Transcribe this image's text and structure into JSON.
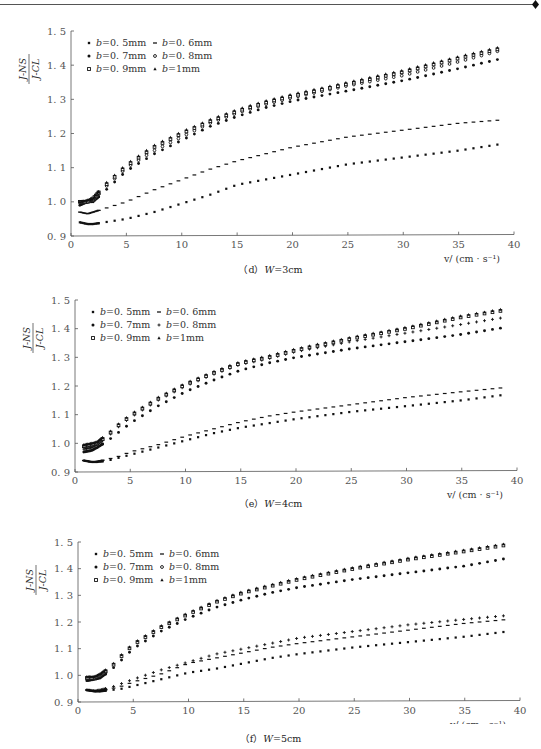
{
  "page": {
    "header_text": "· · · · · · ·"
  },
  "common": {
    "ylabel_num": "J-NS",
    "ylabel_den": "J-CL",
    "xlabel": "v/ (cm · s⁻¹)",
    "xticks": [
      0,
      5,
      10,
      15,
      20,
      25,
      30,
      35,
      40
    ],
    "yticks": [
      "0. 9",
      "1. 0",
      "1. 1",
      "1. 2",
      "1. 3",
      "1. 4",
      "1. 5"
    ],
    "legend": [
      {
        "label": "b=0. 5mm",
        "marker": "square-small"
      },
      {
        "label": "b=0. 6mm",
        "marker": "dash"
      },
      {
        "label": "b=0. 7mm",
        "marker": "dot"
      },
      {
        "label": "b=0. 8mm",
        "marker": "circle-open"
      },
      {
        "label": "b=0. 9mm",
        "marker": "square-open"
      },
      {
        "label": "b=1mm",
        "marker": "triangle"
      }
    ]
  },
  "chart_data": [
    {
      "type": "scatter",
      "id": "d",
      "caption_prefix": "（d）",
      "caption_var": "W",
      "caption_value": "=3cm",
      "title": "(d) W=3cm",
      "xlabel": "v/(cm·s⁻¹)",
      "ylabel": "J-NS / J-CL",
      "xlim": [
        0,
        40
      ],
      "ylim": [
        0.9,
        1.5
      ],
      "x": [
        0.8,
        1.5,
        2,
        3,
        4,
        5,
        7.5,
        10,
        12.5,
        15,
        17.5,
        20,
        25,
        30,
        35,
        39
      ],
      "series": [
        {
          "name": "b=0.5mm",
          "values": [
            0.94,
            0.935,
            0.935,
            0.94,
            0.945,
            0.95,
            0.97,
            0.995,
            1.02,
            1.05,
            1.065,
            1.08,
            1.11,
            1.13,
            1.15,
            1.17
          ]
        },
        {
          "name": "b=0.6mm",
          "values": [
            0.97,
            0.965,
            0.97,
            0.98,
            0.99,
            1.0,
            1.035,
            1.065,
            1.095,
            1.12,
            1.14,
            1.16,
            1.19,
            1.21,
            1.23,
            1.24
          ]
        },
        {
          "name": "b=0.7mm",
          "values": [
            0.99,
            1.0,
            1.0,
            1.03,
            1.06,
            1.09,
            1.14,
            1.18,
            1.22,
            1.25,
            1.275,
            1.295,
            1.325,
            1.355,
            1.39,
            1.42
          ]
        },
        {
          "name": "b=0.8mm",
          "values": [
            1.0,
            1.0,
            1.005,
            1.04,
            1.07,
            1.1,
            1.15,
            1.19,
            1.23,
            1.26,
            1.285,
            1.305,
            1.34,
            1.37,
            1.41,
            1.445
          ]
        },
        {
          "name": "b=0.9mm",
          "values": [
            1.0,
            1.0,
            1.01,
            1.045,
            1.075,
            1.105,
            1.16,
            1.2,
            1.235,
            1.265,
            1.29,
            1.31,
            1.345,
            1.38,
            1.42,
            1.45
          ]
        },
        {
          "name": "b=1mm",
          "values": [
            1.0,
            1.005,
            1.01,
            1.05,
            1.08,
            1.11,
            1.165,
            1.205,
            1.24,
            1.27,
            1.295,
            1.315,
            1.35,
            1.385,
            1.425,
            1.455
          ]
        }
      ],
      "legend_position": "upper-left"
    },
    {
      "type": "scatter",
      "id": "e",
      "caption_prefix": "（e）",
      "caption_var": "W",
      "caption_value": "=4cm",
      "title": "(e) W=4cm",
      "xlabel": "v/(cm·s⁻¹)",
      "ylabel": "J-NS / J-CL",
      "xlim": [
        0,
        40
      ],
      "ylim": [
        0.9,
        1.5
      ],
      "x": [
        0.8,
        1.5,
        2,
        3,
        4,
        5,
        7.5,
        10,
        12.5,
        15,
        17.5,
        20,
        25,
        30,
        35,
        39
      ],
      "series": [
        {
          "name": "b=0.5mm",
          "values": [
            0.94,
            0.935,
            0.935,
            0.94,
            0.95,
            0.96,
            0.985,
            1.01,
            1.035,
            1.055,
            1.07,
            1.085,
            1.11,
            1.13,
            1.15,
            1.17
          ]
        },
        {
          "name": "b=0.6mm",
          "values": [
            0.94,
            0.935,
            0.937,
            0.945,
            0.955,
            0.97,
            0.995,
            1.025,
            1.05,
            1.075,
            1.095,
            1.11,
            1.135,
            1.16,
            1.18,
            1.195
          ]
        },
        {
          "name": "b=0.7mm",
          "values": [
            0.97,
            0.975,
            0.985,
            1.01,
            1.04,
            1.07,
            1.13,
            1.18,
            1.22,
            1.255,
            1.28,
            1.3,
            1.33,
            1.355,
            1.38,
            1.405
          ]
        },
        {
          "name": "b=0.8mm",
          "values": [
            0.98,
            0.985,
            0.995,
            1.025,
            1.06,
            1.09,
            1.15,
            1.2,
            1.24,
            1.275,
            1.295,
            1.32,
            1.355,
            1.385,
            1.415,
            1.44
          ]
        },
        {
          "name": "b=0.9mm",
          "values": [
            0.99,
            0.995,
            1.0,
            1.03,
            1.065,
            1.095,
            1.155,
            1.205,
            1.245,
            1.28,
            1.3,
            1.325,
            1.365,
            1.4,
            1.44,
            1.465
          ]
        },
        {
          "name": "b=1mm",
          "values": [
            0.995,
            1.0,
            1.005,
            1.035,
            1.07,
            1.1,
            1.16,
            1.21,
            1.25,
            1.285,
            1.305,
            1.33,
            1.37,
            1.405,
            1.445,
            1.47
          ]
        }
      ],
      "legend_position": "upper-left"
    },
    {
      "type": "scatter",
      "id": "f",
      "caption_prefix": "（f）",
      "caption_var": "W",
      "caption_value": "=5cm",
      "title": "(f) W=5cm",
      "xlabel": "v/(cm·s⁻¹)",
      "ylabel": "J-NS / J-CL",
      "xlim": [
        0,
        40
      ],
      "ylim": [
        0.9,
        1.5
      ],
      "x": [
        0.8,
        1.5,
        2,
        3,
        4,
        5,
        7.5,
        10,
        12.5,
        15,
        17.5,
        20,
        25,
        30,
        35,
        39
      ],
      "series": [
        {
          "name": "b=0.5mm",
          "values": [
            0.945,
            0.94,
            0.94,
            0.945,
            0.95,
            0.96,
            0.985,
            1.01,
            1.025,
            1.045,
            1.065,
            1.08,
            1.105,
            1.125,
            1.145,
            1.165
          ]
        },
        {
          "name": "b=0.6mm",
          "values": [
            0.945,
            0.94,
            0.942,
            0.95,
            0.96,
            0.975,
            1.005,
            1.045,
            1.065,
            1.085,
            1.105,
            1.12,
            1.145,
            1.17,
            1.195,
            1.21
          ]
        },
        {
          "name": "b=0.7mm",
          "values": [
            0.98,
            0.985,
            0.99,
            1.02,
            1.06,
            1.1,
            1.165,
            1.215,
            1.255,
            1.285,
            1.31,
            1.33,
            1.36,
            1.385,
            1.41,
            1.44
          ]
        },
        {
          "name": "b=0.8mm",
          "values": [
            0.945,
            0.942,
            0.945,
            0.955,
            0.97,
            0.985,
            1.02,
            1.05,
            1.08,
            1.1,
            1.12,
            1.14,
            1.165,
            1.19,
            1.21,
            1.225
          ]
        },
        {
          "name": "b=0.9mm",
          "values": [
            0.99,
            0.99,
            1.0,
            1.03,
            1.075,
            1.115,
            1.18,
            1.23,
            1.275,
            1.31,
            1.335,
            1.36,
            1.4,
            1.435,
            1.465,
            1.49
          ]
        },
        {
          "name": "b=1mm",
          "values": [
            0.995,
            0.995,
            1.005,
            1.035,
            1.08,
            1.12,
            1.185,
            1.235,
            1.28,
            1.315,
            1.34,
            1.365,
            1.405,
            1.44,
            1.47,
            1.495
          ]
        }
      ],
      "legend_position": "upper-left"
    }
  ]
}
